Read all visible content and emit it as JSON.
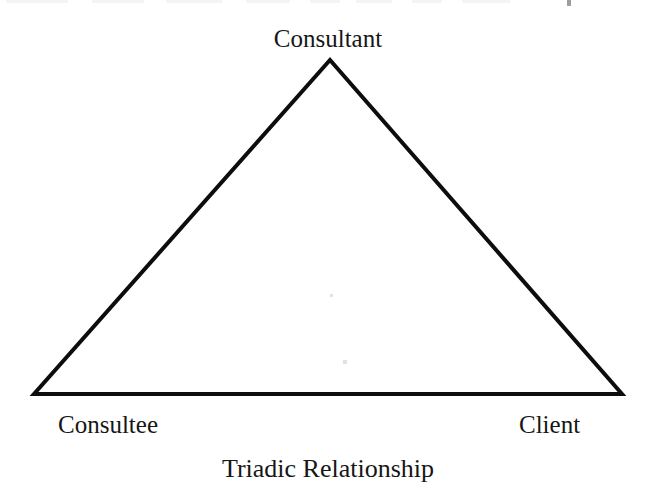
{
  "figure": {
    "caption": "Triadic Relationship",
    "background_color": "#ffffff",
    "ink_color": "#161616"
  },
  "diagram": {
    "type": "triangle",
    "stroke_color": "#0d0d0d",
    "stroke_width": 4,
    "vertices": [
      {
        "id": "consultant",
        "label": "Consultant",
        "x": 330,
        "y": 60,
        "position": "apex"
      },
      {
        "id": "consultee",
        "label": "Consultee",
        "x": 34,
        "y": 394,
        "position": "bottom-left"
      },
      {
        "id": "client",
        "label": "Client",
        "x": 622,
        "y": 394,
        "position": "bottom-right"
      }
    ],
    "edges": [
      {
        "from": "consultant",
        "to": "consultee"
      },
      {
        "from": "consultee",
        "to": "client"
      },
      {
        "from": "client",
        "to": "consultant"
      }
    ]
  },
  "labels": {
    "consultant": "Consultant",
    "consultee": "Consultee",
    "client": "Client"
  }
}
